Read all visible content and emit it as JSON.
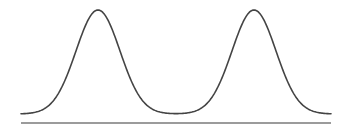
{
  "diagram": {
    "type": "bimodal-distribution-curve",
    "width": 347,
    "height": 130,
    "curve": {
      "x_start": 21,
      "x_end": 331,
      "baseline_y": 114,
      "peak_y": 10,
      "peaks": [
        {
          "center_x": 98,
          "sigma": 22
        },
        {
          "center_x": 254,
          "sigma": 22
        }
      ],
      "stroke_color": "#444444",
      "stroke_width": 1.6
    },
    "axis_line": {
      "x1": 21,
      "x2": 331,
      "y": 123,
      "stroke_color": "#7a7a7a",
      "stroke_width": 1.5
    }
  }
}
